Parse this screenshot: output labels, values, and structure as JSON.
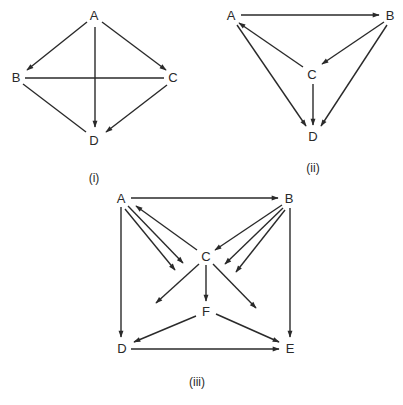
{
  "diagrams": [
    {
      "caption": "(i)",
      "nodes": {
        "A": {
          "label": "A",
          "x": 94,
          "y": 15
        },
        "B": {
          "label": "B",
          "x": 16,
          "y": 77
        },
        "C": {
          "label": "C",
          "x": 173,
          "y": 77
        },
        "D": {
          "label": "D",
          "x": 94,
          "y": 140
        }
      },
      "edges": [
        {
          "from": "A",
          "to": "B",
          "directed": true
        },
        {
          "from": "A",
          "to": "C",
          "directed": true
        },
        {
          "from": "A",
          "to": "D",
          "directed": true
        },
        {
          "from": "C",
          "to": "D",
          "directed": true
        },
        {
          "from": "B",
          "to": "C",
          "directed": false
        },
        {
          "from": "B",
          "to": "D",
          "directed": false
        }
      ]
    },
    {
      "caption": "(ii)",
      "nodes": {
        "A": {
          "label": "A",
          "x": 231,
          "y": 15
        },
        "B": {
          "label": "B",
          "x": 390,
          "y": 15
        },
        "C": {
          "label": "C",
          "x": 312,
          "y": 74
        },
        "D": {
          "label": "D",
          "x": 313,
          "y": 136
        }
      },
      "edges": [
        {
          "from": "A",
          "to": "B",
          "directed": true
        },
        {
          "from": "B",
          "to": "C",
          "directed": true
        },
        {
          "from": "C",
          "to": "A",
          "directed": true
        },
        {
          "from": "A",
          "to": "D",
          "directed": true
        },
        {
          "from": "C",
          "to": "D",
          "directed": true
        },
        {
          "from": "B",
          "to": "D",
          "directed": true
        }
      ]
    },
    {
      "caption": "(iii)",
      "nodes": {
        "A": {
          "label": "A",
          "x": 121,
          "y": 198
        },
        "B": {
          "label": "B",
          "x": 289,
          "y": 198
        },
        "C": {
          "label": "C",
          "x": 206,
          "y": 256
        },
        "F": {
          "label": "F",
          "x": 206,
          "y": 311
        },
        "D": {
          "label": "D",
          "x": 122,
          "y": 348
        },
        "E": {
          "label": "E",
          "x": 290,
          "y": 348
        }
      },
      "edges": [
        {
          "from": "A",
          "to": "B",
          "directed": true
        },
        {
          "from": "A",
          "to": "D",
          "directed": true
        },
        {
          "from": "B",
          "to": "E",
          "directed": true
        },
        {
          "from": "D",
          "to": "E",
          "directed": true
        },
        {
          "from": "C",
          "to": "A",
          "directed": true
        },
        {
          "from": "B",
          "to": "C",
          "directed": true
        },
        {
          "from": "C",
          "to": "F",
          "directed": true
        },
        {
          "from": "F",
          "to": "D",
          "directed": true
        },
        {
          "from": "F",
          "to": "E",
          "directed": true
        },
        {
          "from": "A",
          "to": "(toward C, open end)",
          "directed": true
        },
        {
          "from": "A",
          "to": "(toward C, open end)",
          "directed": true
        },
        {
          "from": "B",
          "to": "(toward C, open end)",
          "directed": true
        },
        {
          "from": "B",
          "to": "(toward C, open end)",
          "directed": true
        },
        {
          "from": "C",
          "to": "(toward D, open end)",
          "directed": true
        },
        {
          "from": "C",
          "to": "(toward E, open end)",
          "directed": true
        }
      ]
    }
  ]
}
